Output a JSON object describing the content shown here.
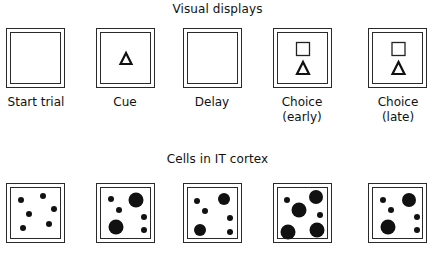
{
  "titles": {
    "top": "Visual displays",
    "bottom": "Cells in IT cortex"
  },
  "displays": [
    {
      "label_line1": "Start trial",
      "label_line2": "",
      "stimuli": []
    },
    {
      "label_line1": "Cue",
      "label_line2": "",
      "stimuli": [
        "triangle"
      ]
    },
    {
      "label_line1": "Delay",
      "label_line2": "",
      "stimuli": []
    },
    {
      "label_line1": "Choice",
      "label_line2": "(early)",
      "stimuli": [
        "square",
        "triangle"
      ]
    },
    {
      "label_line1": "Choice",
      "label_line2": "(late)",
      "stimuli": [
        "square",
        "triangle"
      ]
    }
  ],
  "cells": [
    {
      "stage": "Start trial",
      "dots": [
        [
          21,
          200,
          3
        ],
        [
          43,
          196,
          3
        ],
        [
          54,
          209,
          3
        ],
        [
          29,
          214,
          3
        ],
        [
          23,
          228,
          3
        ],
        [
          49,
          224,
          3
        ]
      ]
    },
    {
      "stage": "Cue",
      "dots": [
        [
          111,
          199,
          3
        ],
        [
          136,
          200,
          7.5
        ],
        [
          119,
          210,
          3
        ],
        [
          144,
          217,
          3
        ],
        [
          116,
          227,
          7.5
        ],
        [
          144,
          230,
          3
        ]
      ]
    },
    {
      "stage": "Delay",
      "dots": [
        [
          197,
          201,
          3
        ],
        [
          224,
          199,
          6
        ],
        [
          205,
          211,
          3
        ],
        [
          230,
          218,
          3
        ],
        [
          200,
          230,
          6
        ],
        [
          230,
          232,
          3
        ]
      ]
    },
    {
      "stage": "Choice (early)",
      "dots": [
        [
          287,
          200,
          3
        ],
        [
          316,
          197,
          7
        ],
        [
          299,
          210,
          7.5
        ],
        [
          320,
          215,
          3
        ],
        [
          288,
          232,
          7.5
        ],
        [
          317,
          230,
          7.5
        ]
      ]
    },
    {
      "stage": "Choice (late)",
      "dots": [
        [
          383,
          200,
          3
        ],
        [
          409,
          200,
          7
        ],
        [
          391,
          210,
          3
        ],
        [
          417,
          217,
          3
        ],
        [
          388,
          227,
          7.5
        ],
        [
          417,
          230,
          3
        ]
      ]
    }
  ],
  "colors": {
    "ink": "#111111",
    "frame": "#2a2a2a",
    "background": "#ffffff"
  }
}
